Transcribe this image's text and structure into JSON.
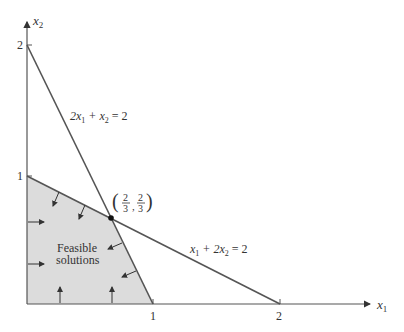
{
  "diagram": {
    "type": "linear-programming-feasible-region",
    "axes": {
      "x": {
        "label": "x",
        "sub": "1",
        "ticks": [
          "1",
          "2"
        ]
      },
      "y": {
        "label": "x",
        "sub": "2",
        "ticks": [
          "1",
          "2"
        ]
      }
    },
    "constraints": [
      {
        "id": "c1",
        "equation_parts": [
          "2x",
          "1",
          " + x",
          "2",
          " = 2"
        ],
        "text": "2x1 + x2 = 2",
        "from": [
          0,
          2
        ],
        "to": [
          1,
          0
        ]
      },
      {
        "id": "c2",
        "equation_parts": [
          "x",
          "1",
          " + 2x",
          "2",
          " = 2"
        ],
        "text": "x1 + 2x2 = 2",
        "from": [
          0,
          1
        ],
        "to": [
          2,
          0
        ]
      }
    ],
    "vertex": {
      "label": "(2/3, 2/3)",
      "num1": "2",
      "den1": "3",
      "num2": "2",
      "den2": "3",
      "x": 0.6667,
      "y": 0.6667
    },
    "region": {
      "label_line1": "Feasible",
      "label_line2": "solutions",
      "fill": "#d9d9d9"
    },
    "colors": {
      "line": "#555555",
      "axis": "#555555",
      "text": "#333333"
    }
  }
}
